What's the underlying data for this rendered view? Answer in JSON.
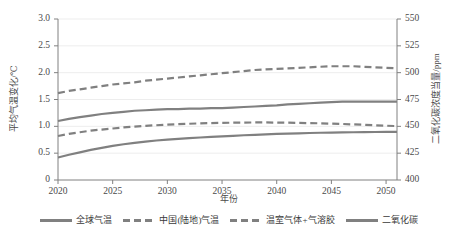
{
  "chart_data": {
    "type": "line",
    "title": "",
    "xlabel": "年份",
    "ylabel": "平均气温变化/℃",
    "ylabel_right": "二氧化碳浓度当量/ppm",
    "xlim": [
      2020,
      2051
    ],
    "ylim": [
      0,
      3.0
    ],
    "ylim_right": [
      400,
      550
    ],
    "grid": true,
    "legend_position": "bottom",
    "x_ticks": [
      "2020",
      "2025",
      "2030",
      "2035",
      "2040",
      "2045",
      "2050"
    ],
    "y_ticks_left": [
      "0",
      "0.5",
      "1.0",
      "1.5",
      "2.0",
      "2.5",
      "3.0"
    ],
    "y_ticks_right": [
      "400",
      "425",
      "450",
      "475",
      "500",
      "525",
      "550"
    ],
    "line_color": "#808080",
    "x": [
      2020,
      2021,
      2022,
      2023,
      2024,
      2025,
      2026,
      2027,
      2028,
      2029,
      2030,
      2031,
      2032,
      2033,
      2034,
      2035,
      2036,
      2037,
      2038,
      2039,
      2040,
      2041,
      2042,
      2043,
      2044,
      2045,
      2046,
      2047,
      2048,
      2049,
      2050,
      2051
    ],
    "series": [
      {
        "name": "全球气温",
        "style": "solid",
        "axis": "left",
        "values": [
          1.1,
          1.14,
          1.17,
          1.2,
          1.23,
          1.25,
          1.27,
          1.29,
          1.3,
          1.31,
          1.32,
          1.32,
          1.33,
          1.33,
          1.34,
          1.34,
          1.35,
          1.36,
          1.37,
          1.38,
          1.39,
          1.41,
          1.42,
          1.43,
          1.44,
          1.45,
          1.46,
          1.46,
          1.46,
          1.46,
          1.46,
          1.46
        ]
      },
      {
        "name": "中国(陆地)气温",
        "style": "dashed",
        "axis": "left",
        "values": [
          1.62,
          1.66,
          1.69,
          1.72,
          1.75,
          1.78,
          1.8,
          1.82,
          1.85,
          1.87,
          1.89,
          1.91,
          1.93,
          1.95,
          1.97,
          1.99,
          2.01,
          2.03,
          2.05,
          2.06,
          2.07,
          2.08,
          2.09,
          2.1,
          2.11,
          2.12,
          2.12,
          2.12,
          2.11,
          2.1,
          2.09,
          2.08
        ]
      },
      {
        "name": "温室气体+气溶胶",
        "style": "dashed",
        "axis": "right",
        "values": [
          441,
          443,
          444.5,
          446,
          447,
          448,
          449,
          449.8,
          450.5,
          451,
          451.5,
          452,
          452.4,
          452.8,
          453,
          453.2,
          453.4,
          453.5,
          453.6,
          453.6,
          453.5,
          453.4,
          453.2,
          453,
          452.8,
          452.5,
          452.2,
          451.8,
          451.4,
          451,
          450.6,
          450.2
        ]
      },
      {
        "name": "二氧化碳",
        "style": "solid",
        "axis": "right",
        "values": [
          421,
          423.5,
          425.8,
          428,
          430,
          431.8,
          433.3,
          434.6,
          435.8,
          436.8,
          437.6,
          438.3,
          439,
          439.6,
          440.2,
          440.7,
          441.2,
          441.7,
          442.1,
          442.5,
          442.9,
          443.2,
          443.5,
          443.8,
          444,
          444.2,
          444.4,
          444.5,
          444.6,
          444.7,
          444.8,
          444.8
        ]
      }
    ]
  },
  "legend": [
    {
      "label": "全球气温",
      "style": "solid"
    },
    {
      "label": "中国(陆地)气温",
      "style": "dashed"
    },
    {
      "label": "温室气体+气溶胶",
      "style": "dashed"
    },
    {
      "label": "二氧化碳",
      "style": "solid"
    }
  ]
}
